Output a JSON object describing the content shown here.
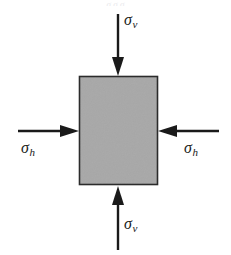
{
  "figure": {
    "background_color": "#ffffff",
    "width": 231,
    "height": 255
  },
  "element": {
    "name": "soil-element",
    "shape": "rectangle",
    "fill_color": "#a8a8a8",
    "stroke_color": "#2b2b2b",
    "x": 79,
    "y": 76,
    "width": 79,
    "height": 109
  },
  "labels": {
    "sigma_v_top": {
      "symbol": "σ",
      "subscript": "v"
    },
    "sigma_v_bottom": {
      "symbol": "σ",
      "subscript": "v"
    },
    "sigma_h_left": {
      "symbol": "σ",
      "subscript": "h"
    },
    "sigma_h_right": {
      "symbol": "σ",
      "subscript": "h"
    }
  },
  "arrows": [
    {
      "name": "arrow-sigma-v-top",
      "direction": "down",
      "color": "#1a1a1a"
    },
    {
      "name": "arrow-sigma-v-bottom",
      "direction": "up",
      "color": "#1a1a1a"
    },
    {
      "name": "arrow-sigma-h-left",
      "direction": "right",
      "color": "#1a1a1a"
    },
    {
      "name": "arrow-sigma-h-right",
      "direction": "left",
      "color": "#1a1a1a"
    }
  ],
  "caption_ghost": "σ  σ  σ"
}
